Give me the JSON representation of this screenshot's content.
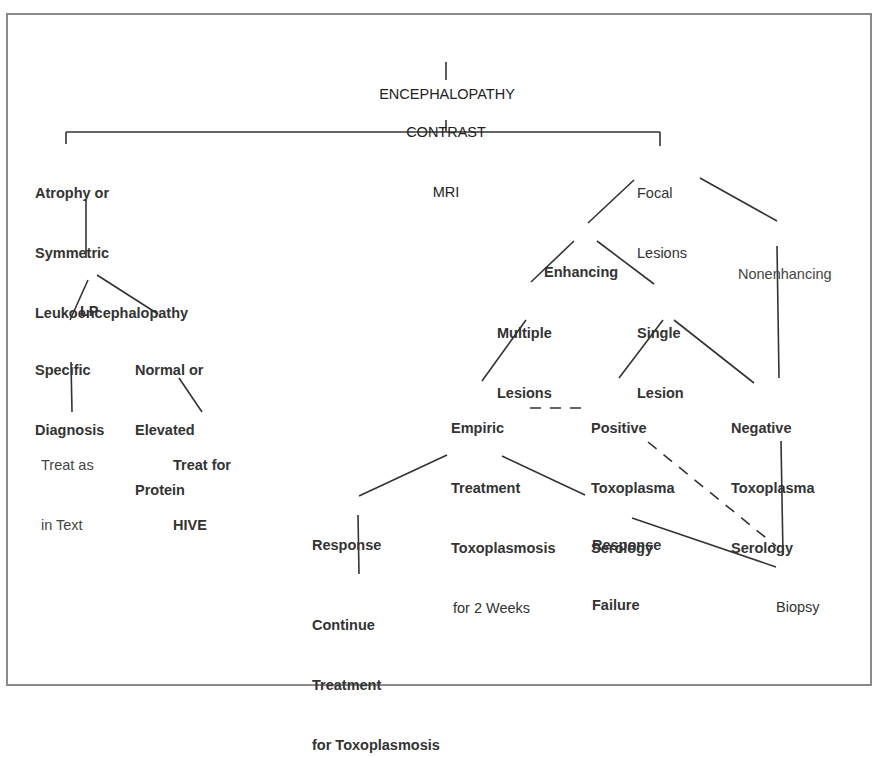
{
  "diagram": {
    "type": "flowchart",
    "nodes": {
      "encephalopathy": {
        "lines": [
          "ENCEPHALOPATHY"
        ]
      },
      "contrast_mri": {
        "lines": [
          "CONTRAST",
          "MRI"
        ]
      },
      "atrophy": {
        "lines": [
          "Atrophy or",
          "Symmetric",
          "Leukoencephalopathy"
        ]
      },
      "lp": {
        "lines": [
          "LP"
        ]
      },
      "specific_diagnosis": {
        "lines": [
          "Specific",
          "Diagnosis"
        ]
      },
      "normal_elevated_protein": {
        "lines": [
          "Normal or",
          "Elevated",
          "Protein"
        ]
      },
      "treat_as_in_text": {
        "lines": [
          "Treat as",
          "in Text"
        ]
      },
      "treat_for_hive": {
        "lines": [
          "Treat for",
          "HIVE"
        ]
      },
      "focal_lesions": {
        "lines": [
          "Focal",
          "Lesions"
        ]
      },
      "enhancing": {
        "lines": [
          "Enhancing"
        ]
      },
      "nonenhancing": {
        "lines": [
          "Nonenhancing"
        ]
      },
      "multiple_lesions": {
        "lines": [
          "Multiple",
          "Lesions"
        ]
      },
      "single_lesion": {
        "lines": [
          "Single",
          "Lesion"
        ]
      },
      "empiric_treatment": {
        "lines": [
          "Empiric",
          "Treatment",
          "Toxoplasmosis",
          "for 2 Weeks"
        ]
      },
      "positive_serology": {
        "lines": [
          "Positive",
          "Toxoplasma",
          "Serology"
        ]
      },
      "negative_serology": {
        "lines": [
          "Negative",
          "Toxoplasma",
          "Serology"
        ]
      },
      "response": {
        "lines": [
          "Response"
        ]
      },
      "response_failure": {
        "lines": [
          "Response",
          "Failure"
        ]
      },
      "continue_treatment": {
        "lines": [
          "Continue",
          "Treatment",
          "for Toxoplasmosis"
        ]
      },
      "biopsy": {
        "lines": [
          "Biopsy"
        ]
      }
    },
    "edges": [
      {
        "from": "encephalopathy",
        "to": "contrast_mri",
        "style": "solid"
      },
      {
        "from": "contrast_mri",
        "to": "atrophy",
        "style": "solid"
      },
      {
        "from": "contrast_mri",
        "to": "focal_lesions",
        "style": "solid"
      },
      {
        "from": "atrophy",
        "to": "lp",
        "style": "solid"
      },
      {
        "from": "lp",
        "to": "specific_diagnosis",
        "style": "solid"
      },
      {
        "from": "lp",
        "to": "normal_elevated_protein",
        "style": "solid"
      },
      {
        "from": "specific_diagnosis",
        "to": "treat_as_in_text",
        "style": "solid"
      },
      {
        "from": "normal_elevated_protein",
        "to": "treat_for_hive",
        "style": "solid"
      },
      {
        "from": "focal_lesions",
        "to": "enhancing",
        "style": "solid"
      },
      {
        "from": "focal_lesions",
        "to": "nonenhancing",
        "style": "solid"
      },
      {
        "from": "enhancing",
        "to": "multiple_lesions",
        "style": "solid"
      },
      {
        "from": "enhancing",
        "to": "single_lesion",
        "style": "solid"
      },
      {
        "from": "multiple_lesions",
        "to": "empiric_treatment",
        "style": "solid"
      },
      {
        "from": "single_lesion",
        "to": "positive_serology",
        "style": "solid"
      },
      {
        "from": "single_lesion",
        "to": "negative_serology",
        "style": "solid"
      },
      {
        "from": "nonenhancing",
        "to": "negative_serology",
        "style": "solid"
      },
      {
        "from": "positive_serology",
        "to": "empiric_treatment",
        "style": "dashed"
      },
      {
        "from": "empiric_treatment",
        "to": "response",
        "style": "solid"
      },
      {
        "from": "empiric_treatment",
        "to": "response_failure",
        "style": "solid"
      },
      {
        "from": "response",
        "to": "continue_treatment",
        "style": "solid"
      },
      {
        "from": "response_failure",
        "to": "biopsy",
        "style": "solid"
      },
      {
        "from": "positive_serology",
        "to": "biopsy",
        "style": "dashed"
      },
      {
        "from": "negative_serology",
        "to": "biopsy",
        "style": "solid"
      }
    ]
  }
}
